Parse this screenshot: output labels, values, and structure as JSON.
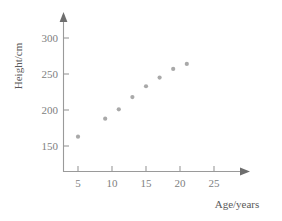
{
  "chart_data": {
    "type": "scatter",
    "title": "",
    "xlabel": "Age/years",
    "ylabel": "Height/cm",
    "x": [
      5,
      9,
      11,
      13,
      15,
      17,
      19,
      21
    ],
    "values": [
      163,
      188,
      201,
      218,
      233,
      245,
      257,
      264
    ],
    "series": [
      {
        "name": "",
        "points": [
          {
            "x": 5,
            "y": 163
          },
          {
            "x": 9,
            "y": 188
          },
          {
            "x": 11,
            "y": 201
          },
          {
            "x": 13,
            "y": 218
          },
          {
            "x": 15,
            "y": 233
          },
          {
            "x": 17,
            "y": 245
          },
          {
            "x": 19,
            "y": 257
          },
          {
            "x": 21,
            "y": 264
          }
        ]
      }
    ],
    "xticks": [
      5,
      10,
      15,
      20,
      25
    ],
    "yticks": [
      150,
      200,
      250,
      300
    ],
    "xlim": [
      2,
      28
    ],
    "ylim": [
      128,
      318
    ],
    "grid": false,
    "legend": null,
    "marker_color": "#a9a9a9",
    "axis_color": "#9a9a9a"
  },
  "axes": {
    "x_title": "Age/years",
    "y_title": "Height/cm",
    "x_tick_labels": [
      "5",
      "10",
      "15",
      "20",
      "25"
    ],
    "y_tick_labels": [
      "150",
      "200",
      "250",
      "300"
    ]
  }
}
